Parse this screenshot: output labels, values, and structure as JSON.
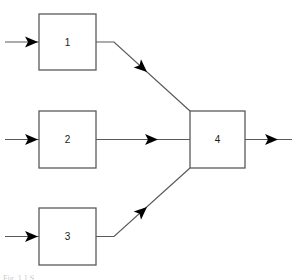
{
  "figure": {
    "background_color": "#ffffff",
    "stroke_color": "#5a5a5a",
    "arrow_color": "#000000",
    "label_color": "#1a1a1a",
    "caption": "Fig. 1.1  S"
  },
  "blocks": [
    {
      "id": "block-1",
      "label": "1",
      "x": 39,
      "y": 14,
      "width": 57,
      "height": 56,
      "center_x": 67.5,
      "center_y": 42
    },
    {
      "id": "block-2",
      "label": "2",
      "x": 39,
      "y": 111,
      "width": 57,
      "height": 57,
      "center_x": 67.5,
      "center_y": 139.5
    },
    {
      "id": "block-3",
      "label": "3",
      "x": 39,
      "y": 208,
      "width": 57,
      "height": 57,
      "center_x": 67.5,
      "center_y": 236.5
    },
    {
      "id": "block-4",
      "label": "4",
      "x": 190,
      "y": 111,
      "width": 55,
      "height": 57,
      "center_x": 217.5,
      "center_y": 139.5
    }
  ],
  "connections": [
    {
      "id": "input-arrow-1",
      "from": "external-input",
      "to": "block-1",
      "path": "M 5 42 L 39 42",
      "arrow_x": 25,
      "arrow_y": 42,
      "direction": "right"
    },
    {
      "id": "input-arrow-2",
      "from": "external-input",
      "to": "block-2",
      "path": "M 5 139.5 L 39 139.5",
      "arrow_x": 25,
      "arrow_y": 139.5,
      "direction": "right"
    },
    {
      "id": "input-arrow-3",
      "from": "external-input",
      "to": "block-3",
      "path": "M 5 236.5 L 39 236.5",
      "arrow_x": 25,
      "arrow_y": 236.5,
      "direction": "right"
    },
    {
      "id": "link-1-to-4",
      "from": "block-1",
      "to": "block-4",
      "path": "M 96 42 L 114 42 L 190 111",
      "arrow_x": 147,
      "arrow_y": 72,
      "direction": "down-right"
    },
    {
      "id": "link-2-to-4",
      "from": "block-2",
      "to": "block-4",
      "path": "M 96 139.5 L 190 139.5",
      "arrow_x": 152,
      "arrow_y": 139.5,
      "direction": "right"
    },
    {
      "id": "link-3-to-4",
      "from": "block-3",
      "to": "block-4",
      "path": "M 96 236.5 L 114 236.5 L 190 168",
      "arrow_x": 147,
      "arrow_y": 207,
      "direction": "up-right"
    },
    {
      "id": "output-arrow-4",
      "from": "block-4",
      "to": "external-output",
      "path": "M 245 139.5 L 292 139.5",
      "arrow_x": 265,
      "arrow_y": 139.5,
      "direction": "right"
    }
  ]
}
